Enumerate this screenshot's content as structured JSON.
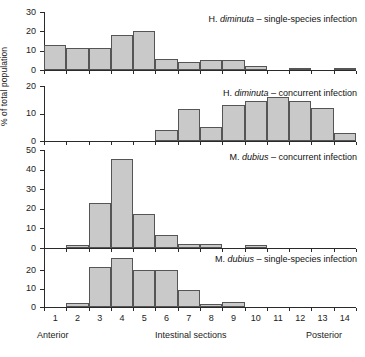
{
  "figure": {
    "ylabel": "% of total population",
    "xlabel_center": "Intestinal sections",
    "xlabel_left": "Anterior",
    "xlabel_right": "Posterior",
    "bar_fill": "#c9c9c9",
    "bar_stroke": "#555555",
    "axis_color": "#2a2a2a"
  },
  "chart_data": {
    "type": "bar",
    "xlabel": "Intestinal sections",
    "ylabel": "% of total population",
    "categories": [
      "1",
      "2",
      "3",
      "4",
      "5",
      "6",
      "7",
      "8",
      "9",
      "10",
      "11",
      "12",
      "13",
      "14"
    ],
    "grid": false,
    "legend": "none",
    "panels": [
      {
        "id": "panel-1",
        "species": "H. diminuta",
        "condition": "single-species infection",
        "title_prefix": "H.",
        "title_italic": "diminuta",
        "title_suffix": "– single-species infection",
        "ylim": [
          0,
          30
        ],
        "yticks": [
          0,
          10,
          20,
          30
        ],
        "values": [
          13,
          11.5,
          11.5,
          18,
          20,
          5.5,
          4,
          5,
          5,
          2,
          0,
          1,
          0,
          1
        ]
      },
      {
        "id": "panel-2",
        "species": "H. diminuta",
        "condition": "concurrent infection",
        "title_prefix": "H.",
        "title_italic": "diminuta",
        "title_suffix": "– concurrent infection",
        "ylim": [
          0,
          20
        ],
        "yticks": [
          0,
          10,
          20
        ],
        "values": [
          0,
          0,
          0,
          0,
          0,
          4,
          11.5,
          5,
          13,
          14.5,
          16,
          14.5,
          12,
          3
        ]
      },
      {
        "id": "panel-3",
        "species": "M. dubius",
        "condition": "concurrent infection",
        "title_prefix": "M.",
        "title_italic": "dubius",
        "title_suffix": "– concurrent infection",
        "ylim": [
          0,
          50
        ],
        "yticks": [
          0,
          10,
          20,
          30,
          40,
          50
        ],
        "values": [
          0,
          1.5,
          23,
          45.5,
          17.5,
          6.5,
          2,
          2,
          0,
          1.5,
          0,
          0,
          0,
          0
        ]
      },
      {
        "id": "panel-4",
        "species": "M. dubius",
        "condition": "single-species infection",
        "title_prefix": "M.",
        "title_italic": "dubius",
        "title_suffix": "– single-species infection",
        "ylim": [
          0,
          30
        ],
        "yticks": [
          0,
          10,
          20
        ],
        "values": [
          0,
          2,
          22,
          27,
          20,
          20,
          9.5,
          1.5,
          2.5,
          0,
          0,
          0,
          0,
          0
        ]
      }
    ]
  }
}
